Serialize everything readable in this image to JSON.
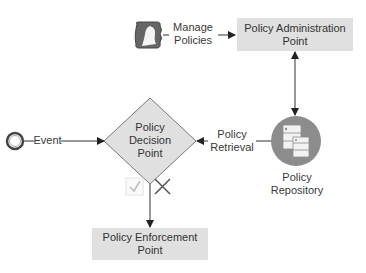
{
  "diagram": {
    "nodes": {
      "start_event": {
        "type": "start-event"
      },
      "admin_user": {
        "type": "user-icon",
        "icon": "user-icon"
      },
      "pap": {
        "label_line1": "Policy Administration",
        "label_line2": "Point"
      },
      "pdp": {
        "label_line1": "Policy",
        "label_line2": "Decision",
        "label_line3": "Point"
      },
      "repository": {
        "label_line1": "Policy",
        "label_line2": "Repository",
        "icon": "database-icon"
      },
      "pep": {
        "label_line1": "Policy Enforcement",
        "label_line2": "Point"
      }
    },
    "edges": {
      "event": {
        "label": "Event"
      },
      "manage_policies": {
        "label_line1": "Manage",
        "label_line2": "Policies"
      },
      "policy_retrieval": {
        "label_line1": "Policy",
        "label_line2": "Retrieval"
      }
    },
    "decision_marks": {
      "approve": "check-icon",
      "deny": "x-icon"
    },
    "colors": {
      "node_fill": "#e0e0e0",
      "repository_fill": "#8c8c8c",
      "line": "#333333"
    }
  }
}
